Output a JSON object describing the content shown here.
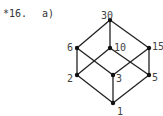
{
  "problem": {
    "number": "*16.",
    "part": "a)"
  },
  "diagram": {
    "type": "hasse-diagram",
    "nodes": [
      {
        "id": "30",
        "x": 110,
        "y": 20,
        "lx": 101,
        "ly": 16
      },
      {
        "id": "6",
        "x": 77,
        "y": 48,
        "lx": 67,
        "ly": 48
      },
      {
        "id": "10",
        "x": 110,
        "y": 48,
        "lx": 114,
        "ly": 48
      },
      {
        "id": "15",
        "x": 149,
        "y": 48,
        "lx": 152,
        "ly": 47
      },
      {
        "id": "2",
        "x": 77,
        "y": 75,
        "lx": 67,
        "ly": 79
      },
      {
        "id": "3",
        "x": 113,
        "y": 75,
        "lx": 116,
        "ly": 79
      },
      {
        "id": "5",
        "x": 149,
        "y": 75,
        "lx": 152,
        "ly": 78
      },
      {
        "id": "1",
        "x": 113,
        "y": 103,
        "lx": 117,
        "ly": 112
      }
    ],
    "edges": [
      [
        "30",
        "6"
      ],
      [
        "30",
        "10"
      ],
      [
        "30",
        "15"
      ],
      [
        "6",
        "2"
      ],
      [
        "6",
        "3"
      ],
      [
        "10",
        "2"
      ],
      [
        "10",
        "5"
      ],
      [
        "15",
        "3"
      ],
      [
        "15",
        "5"
      ],
      [
        "2",
        "1"
      ],
      [
        "3",
        "1"
      ],
      [
        "5",
        "1"
      ]
    ],
    "line_color": "#222222",
    "node_color": "#111111"
  }
}
